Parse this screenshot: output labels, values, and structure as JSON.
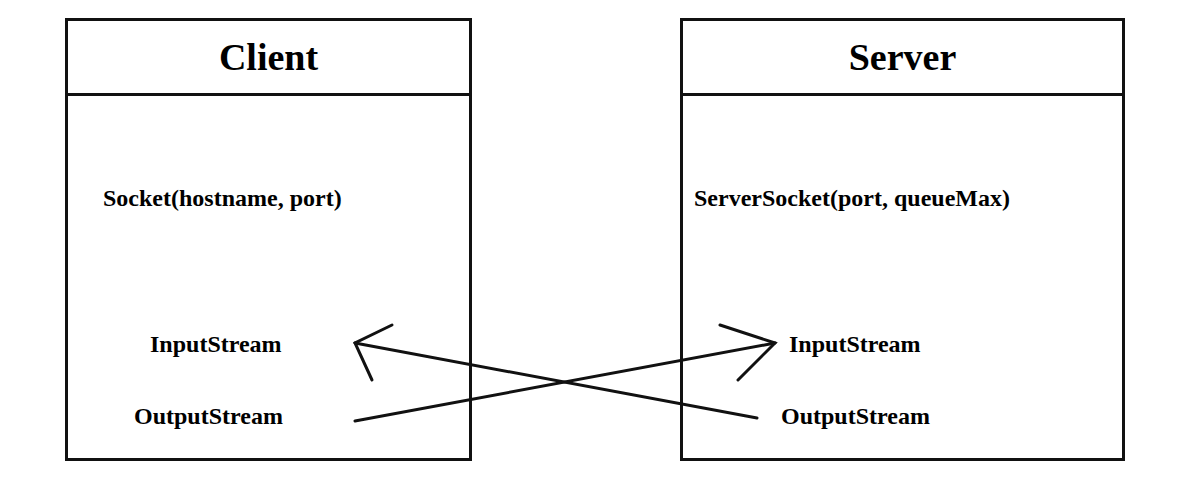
{
  "diagram": {
    "client": {
      "title": "Client",
      "constructor": "Socket(hostname, port)",
      "input_stream": "InputStream",
      "output_stream": "OutputStream"
    },
    "server": {
      "title": "Server",
      "constructor": "ServerSocket(port, queueMax)",
      "input_stream": "InputStream",
      "output_stream": "OutputStream"
    },
    "connections": [
      {
        "from": "client.output_stream",
        "to": "server.input_stream"
      },
      {
        "from": "server.output_stream",
        "to": "client.input_stream"
      }
    ]
  }
}
